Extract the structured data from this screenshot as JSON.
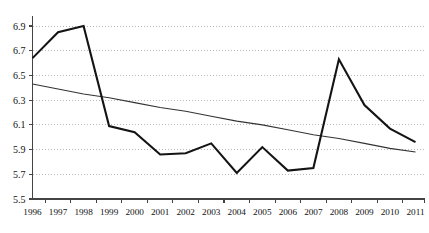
{
  "chart_data": {
    "type": "line",
    "title": "",
    "subtitle": "",
    "xlabel": "",
    "ylabel": "",
    "categories": [
      "1996",
      "1997",
      "1998",
      "1999",
      "2000",
      "2001",
      "2002",
      "2003",
      "2004",
      "2005",
      "2006",
      "2007",
      "2008",
      "2009",
      "2010",
      "2011"
    ],
    "x": [
      1996,
      1997,
      1998,
      1999,
      2000,
      2001,
      2002,
      2003,
      2004,
      2005,
      2006,
      2007,
      2008,
      2009,
      2010,
      2011
    ],
    "series": [
      {
        "name": "series",
        "style": "thick-black-line",
        "color": "#141414",
        "values": [
          6.64,
          6.85,
          6.9,
          6.09,
          6.04,
          5.86,
          5.87,
          5.95,
          5.71,
          5.92,
          5.73,
          5.75,
          6.63,
          6.26,
          6.07,
          5.96
        ]
      },
      {
        "name": "trendline",
        "style": "thin-black-line",
        "color": "#333333",
        "values": [
          6.43,
          6.39,
          6.35,
          6.32,
          6.28,
          6.24,
          6.21,
          6.17,
          6.13,
          6.1,
          6.06,
          6.02,
          5.99,
          5.95,
          5.91,
          5.88
        ]
      }
    ],
    "ylim": [
      5.5,
      6.9
    ],
    "xlim": [
      1996,
      2011
    ],
    "yticks": [
      5.5,
      5.7,
      5.9,
      6.1,
      6.3,
      6.5,
      6.7,
      6.9
    ],
    "ytick_labels": [
      "5.5",
      "5.7",
      "5.9",
      "6.1",
      "6.3",
      "6.5",
      "6.7",
      "6.9"
    ],
    "xtick_labels": [
      "1996",
      "1997",
      "1998",
      "1999",
      "2000",
      "2001",
      "2002",
      "2003",
      "2004",
      "2005",
      "2006",
      "2007",
      "2008",
      "2009",
      "2010",
      "2011"
    ],
    "grid": "horizontal-dotted",
    "legend": "none",
    "annotations": []
  },
  "axes": {
    "axis_color": "#444444",
    "grid_color": "#b9b9b9"
  }
}
